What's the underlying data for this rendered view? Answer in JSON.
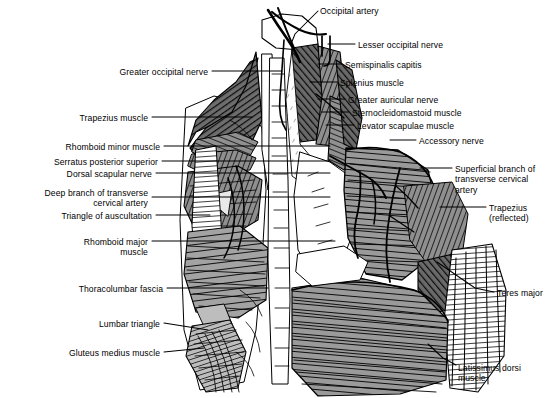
{
  "figure": {
    "width": 560,
    "height": 398,
    "background_color": "#ffffff",
    "ink_color": "#000000"
  },
  "labels": [
    {
      "id": "occipital-artery",
      "text": "Occipital artery",
      "side": "right",
      "x": 320,
      "y": 6,
      "align": "left"
    },
    {
      "id": "lesser-occipital-nerve",
      "text": "Lesser occipital nerve",
      "side": "right",
      "x": 358,
      "y": 40,
      "align": "left"
    },
    {
      "id": "semispinalis-capitis",
      "text": "Semispinalis capitis",
      "side": "right",
      "x": 345,
      "y": 60,
      "align": "left"
    },
    {
      "id": "splenius-muscle",
      "text": "Splenius muscle",
      "side": "right",
      "x": 340,
      "y": 78,
      "align": "left"
    },
    {
      "id": "greater-auricular-nerve",
      "text": "Greater auricular nerve",
      "side": "right",
      "x": 348,
      "y": 95,
      "align": "left"
    },
    {
      "id": "sternocleidomastoid-muscle",
      "text": "Sternocleidomastoid muscle",
      "side": "right",
      "x": 352,
      "y": 108,
      "align": "left"
    },
    {
      "id": "levator-scapulae-muscle",
      "text": "Levator scapulae muscle",
      "side": "right",
      "x": 357,
      "y": 121,
      "align": "left"
    },
    {
      "id": "accessory-nerve",
      "text": "Accessory nerve",
      "side": "right",
      "x": 419,
      "y": 136,
      "align": "left"
    },
    {
      "id": "superficial-branch-tca",
      "text": "Superficial branch of\ntransverse cervical\nartery",
      "side": "right",
      "x": 455,
      "y": 164,
      "align": "left"
    },
    {
      "id": "trapezius-reflected",
      "text": "Trapezius\n(reflected)",
      "side": "right",
      "x": 489,
      "y": 203,
      "align": "left"
    },
    {
      "id": "teres-major",
      "text": "Teres major",
      "side": "right",
      "x": 497,
      "y": 288,
      "align": "left"
    },
    {
      "id": "latissimus-dorsi-muscle",
      "text": "Latissimus dorsi\nmuscle",
      "side": "right",
      "x": 458,
      "y": 363,
      "align": "left"
    },
    {
      "id": "greater-occipital-nerve",
      "text": "Greater occipital nerve",
      "side": "left",
      "x": 208,
      "y": 67,
      "align": "right"
    },
    {
      "id": "trapezius-muscle",
      "text": "Trapezius muscle",
      "side": "left",
      "x": 148,
      "y": 113,
      "align": "right"
    },
    {
      "id": "rhomboid-minor-muscle",
      "text": "Rhomboid minor muscle",
      "side": "left",
      "x": 160,
      "y": 142,
      "align": "right"
    },
    {
      "id": "serratus-posterior-superior",
      "text": "Serratus posterior superior",
      "side": "left",
      "x": 158,
      "y": 157,
      "align": "right"
    },
    {
      "id": "dorsal-scapular-nerve",
      "text": "Dorsal scapular nerve",
      "side": "left",
      "x": 152,
      "y": 169,
      "align": "right"
    },
    {
      "id": "deep-branch-tca",
      "text": "Deep branch of transverse\ncervical artery",
      "side": "left",
      "x": 148,
      "y": 188,
      "align": "right"
    },
    {
      "id": "triangle-of-auscultation",
      "text": "Triangle of auscultation",
      "side": "left",
      "x": 152,
      "y": 211,
      "align": "right"
    },
    {
      "id": "rhomboid-major-muscle",
      "text": "Rhomboid major\nmuscle",
      "side": "left",
      "x": 148,
      "y": 237,
      "align": "right"
    },
    {
      "id": "thoracolumbar-fascia",
      "text": "Thoracolumbar fascia",
      "side": "left",
      "x": 163,
      "y": 284,
      "align": "right"
    },
    {
      "id": "lumbar-triangle",
      "text": "Lumbar triangle",
      "side": "left",
      "x": 160,
      "y": 319,
      "align": "right"
    },
    {
      "id": "gluteus-medius-muscle",
      "text": "Gluteus medius muscle",
      "side": "left",
      "x": 160,
      "y": 348,
      "align": "right"
    }
  ],
  "leaders": [
    {
      "id": "leader-occipital-artery",
      "d": "M 318 11 L 295 34 L 291 44"
    },
    {
      "id": "leader-lesser-occipital-nerve",
      "d": "M 355 44 L 328 44"
    },
    {
      "id": "leader-semispinalis-capitis",
      "d": "M 342 64 L 318 64"
    },
    {
      "id": "leader-splenius-muscle",
      "d": "M 337 82 L 310 82"
    },
    {
      "id": "leader-greater-auricular-nerve",
      "d": "M 345 99 L 318 99"
    },
    {
      "id": "leader-sternocleidomastoid",
      "d": "M 349 112 L 322 112"
    },
    {
      "id": "leader-levator-scapulae",
      "d": "M 354 125 L 326 125"
    },
    {
      "id": "leader-accessory-nerve",
      "d": "M 416 140 L 390 140"
    },
    {
      "id": "leader-superficial-branch-tca",
      "d": "M 452 168 L 420 168"
    },
    {
      "id": "leader-trapezius-reflected",
      "d": "M 486 207 L 440 207"
    },
    {
      "id": "leader-teres-major",
      "d": "M 494 292 L 475 288 L 437 262"
    },
    {
      "id": "leader-latissimus-dorsi",
      "d": "M 456 365 L 443 358 L 428 344"
    },
    {
      "id": "leader-greater-occipital-nerve",
      "d": "M 212 71 L 282 71"
    },
    {
      "id": "leader-trapezius-muscle",
      "d": "M 152 117 L 252 117"
    },
    {
      "id": "leader-rhomboid-minor",
      "d": "M 164 146 L 330 146"
    },
    {
      "id": "leader-serratus-posterior-superior",
      "d": "M 162 161 L 330 161"
    },
    {
      "id": "leader-dorsal-scapular-nerve",
      "d": "M 156 173 L 330 173"
    },
    {
      "id": "leader-deep-branch-tca",
      "d": "M 152 197 L 330 197"
    },
    {
      "id": "leader-triangle-auscultation",
      "d": "M 156 215 L 210 215"
    },
    {
      "id": "leader-rhomboid-major",
      "d": "M 152 241 L 335 241"
    },
    {
      "id": "leader-thoracolumbar-fascia",
      "d": "M 167 288 L 268 288"
    },
    {
      "id": "leader-lumbar-triangle",
      "d": "M 164 323 L 208 330"
    },
    {
      "id": "leader-gluteus-medius",
      "d": "M 164 352 L 204 348"
    }
  ]
}
